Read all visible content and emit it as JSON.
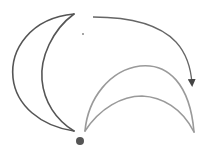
{
  "diagram": {
    "colors": {
      "original_shape": "#555555",
      "rotated_shape": "#9a9a9a",
      "arrow": "#666666",
      "pivot": "#555555",
      "background": "#ffffff"
    },
    "shapes": [
      {
        "id": "original-crescent",
        "label": ""
      },
      {
        "id": "rotated-crescent",
        "label": ""
      }
    ],
    "pivot": {
      "cx": 80,
      "cy": 141,
      "r": 4
    },
    "marker": {
      "cx": 83,
      "cy": 34,
      "r": 1
    }
  }
}
